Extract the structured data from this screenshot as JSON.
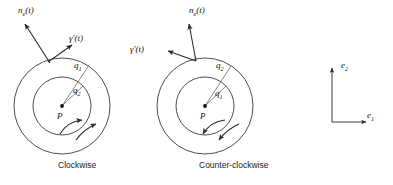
{
  "figure": {
    "stroke_color": "#3a3a3a",
    "text_color": "#1a1a1a",
    "background": "#ffffff"
  },
  "panels": [
    {
      "id": "clockwise",
      "caption": "Clockwise",
      "center_label": "P",
      "outer_radius_label": "q",
      "outer_radius_sub": "1",
      "inner_radius_label": "q",
      "inner_radius_sub": "2",
      "tangent_label": "γ′(t)",
      "normal_label": "n",
      "normal_sub": "e",
      "normal_arg": "(t)",
      "orientation": "clockwise",
      "center": {
        "x": 62,
        "y": 106
      },
      "outer_r": 48,
      "inner_r": 29
    },
    {
      "id": "counter-clockwise",
      "caption": "Counter-clockwise",
      "center_label": "P",
      "outer_radius_label": "q",
      "outer_radius_sub": "2",
      "inner_radius_label": "q",
      "inner_radius_sub": "1",
      "tangent_label": "γ′(t)",
      "normal_label": "n",
      "normal_sub": "e",
      "normal_arg": "(t)",
      "orientation": "counter-clockwise",
      "center": {
        "x": 205,
        "y": 106
      },
      "outer_r": 48,
      "inner_r": 29
    }
  ],
  "basis": {
    "name": "coordinate-frame",
    "e1_label": "e",
    "e1_sub": "1",
    "e2_label": "e",
    "e2_sub": "2",
    "origin": {
      "x": 332,
      "y": 122
    },
    "x_length": 34,
    "y_length": 44
  }
}
